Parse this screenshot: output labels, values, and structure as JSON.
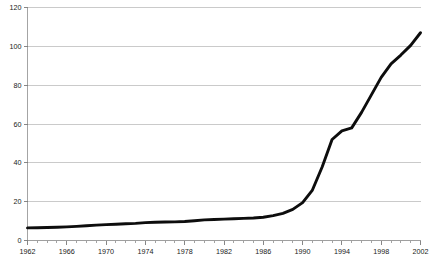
{
  "chart_data": {
    "type": "line",
    "title": "",
    "subtitle": "",
    "xlabel": "",
    "ylabel": "",
    "xlim": [
      1962,
      2002
    ],
    "ylim": [
      0,
      120
    ],
    "yticks": [
      0,
      20,
      40,
      60,
      80,
      100,
      120
    ],
    "ytick_labels": [
      "0",
      "20",
      "40",
      "60",
      "80",
      "100",
      "120"
    ],
    "xticks": [
      1962,
      1966,
      1970,
      1974,
      1978,
      1982,
      1986,
      1990,
      1994,
      1998,
      2002
    ],
    "xtick_labels": [
      "1962",
      "1966",
      "1970",
      "1974",
      "1978",
      "1982",
      "1986",
      "1990",
      "1994",
      "1998",
      "2002"
    ],
    "x_minor_tick_step": 1,
    "grid": true,
    "grid_axis": "y",
    "legend": false,
    "legend_position": "none",
    "line_color": "#0d0d0d",
    "grid_color": "#b4b4b4",
    "axis_color": "#9a9a9a",
    "background": "#ffffff",
    "series": [
      {
        "name": "series-1",
        "x": [
          1962,
          1963,
          1964,
          1965,
          1966,
          1967,
          1968,
          1969,
          1970,
          1971,
          1972,
          1973,
          1974,
          1975,
          1976,
          1977,
          1978,
          1979,
          1980,
          1981,
          1982,
          1983,
          1984,
          1985,
          1986,
          1987,
          1988,
          1989,
          1990,
          1991,
          1992,
          1993,
          1994,
          1995,
          1996,
          1997,
          1998,
          1999,
          2000,
          2001,
          2002
        ],
        "values": [
          6.5,
          6.6,
          6.7,
          6.8,
          7.0,
          7.3,
          7.6,
          7.9,
          8.2,
          8.4,
          8.6,
          8.8,
          9.2,
          9.4,
          9.5,
          9.6,
          9.8,
          10.2,
          10.6,
          10.8,
          11.0,
          11.2,
          11.4,
          11.6,
          12.0,
          12.8,
          14.0,
          16.0,
          19.5,
          26.0,
          38.0,
          52.0,
          56.5,
          58.0,
          66.0,
          75.0,
          84.0,
          91.0,
          95.5,
          100.5,
          107.0
        ]
      }
    ]
  },
  "axis_tick_values": {
    "x_minor": [
      1962,
      1963,
      1964,
      1965,
      1966,
      1967,
      1968,
      1969,
      1970,
      1971,
      1972,
      1973,
      1974,
      1975,
      1976,
      1977,
      1978,
      1979,
      1980,
      1981,
      1982,
      1983,
      1984,
      1985,
      1986,
      1987,
      1988,
      1989,
      1990,
      1991,
      1992,
      1993,
      1994,
      1995,
      1996,
      1997,
      1998,
      1999,
      2000,
      2001,
      2002
    ]
  }
}
